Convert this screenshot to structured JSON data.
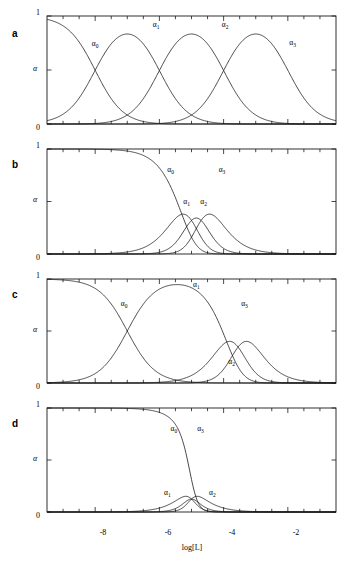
{
  "figure": {
    "axis": {
      "ylabel": "α",
      "ytick_top": "1",
      "ytick_bottom": "0",
      "xlabel": "log[L]",
      "xticks": [
        "-8",
        "-6",
        "-4",
        "-2"
      ],
      "xlim": [
        -9.5,
        -0.5
      ],
      "ylim": [
        0,
        1
      ],
      "xtick_values": [
        -8,
        -6,
        -4,
        -2
      ],
      "xminor_step": 0.5
    },
    "caption": "",
    "series_names": [
      "α0",
      "α1",
      "α2",
      "α3"
    ],
    "panels": [
      {
        "letter": "a",
        "ylabel": "α",
        "ytick_top": "1",
        "ytick_bottom": "0",
        "labels": [
          {
            "base": "α",
            "sub": "0",
            "x": -8.0,
            "y": 0.72
          },
          {
            "base": "α",
            "sub": "1",
            "x": -6.1,
            "y": 0.9
          },
          {
            "base": "α",
            "sub": "2",
            "x": -3.95,
            "y": 0.9
          },
          {
            "base": "α",
            "sub": "3",
            "x": -1.85,
            "y": 0.73
          }
        ],
        "logK": [
          -8.0,
          -6.0,
          -4.0,
          -2.0
        ],
        "description": "Four well separated stepwise constants; each species reaches near unity."
      },
      {
        "letter": "b",
        "ylabel": "α",
        "ytick_top": "1",
        "ytick_bottom": "0",
        "labels": [
          {
            "base": "α",
            "sub": "0",
            "x": -5.65,
            "y": 0.78
          },
          {
            "base": "α",
            "sub": "1",
            "x": -5.15,
            "y": 0.48
          },
          {
            "base": "α",
            "sub": "2",
            "x": -4.62,
            "y": 0.48
          },
          {
            "base": "α",
            "sub": "3",
            "x": -4.05,
            "y": 0.78
          }
        ],
        "logK": [
          -5.3,
          -5.0,
          -4.7,
          -4.4
        ],
        "description": "Closely spaced constants; intermediates only reach about 0.35."
      },
      {
        "letter": "c",
        "ylabel": "α",
        "ytick_top": "1",
        "ytick_bottom": "0",
        "labels": [
          {
            "base": "α",
            "sub": "0",
            "x": -7.1,
            "y": 0.74
          },
          {
            "base": "α",
            "sub": "1",
            "x": -4.85,
            "y": 0.92
          },
          {
            "base": "α",
            "sub": "3",
            "x": -3.35,
            "y": 0.74
          },
          {
            "base": "α",
            "sub": "2",
            "x": -3.75,
            "y": 0.18
          }
        ],
        "logK": [
          -7.0,
          -3.9,
          -3.55,
          -3.2
        ],
        "description": "First step well separated; last two overlap so alpha2 stays low."
      },
      {
        "letter": "d",
        "ylabel": "α",
        "ytick_top": "1",
        "ytick_bottom": "0",
        "labels": [
          {
            "base": "α",
            "sub": "0",
            "x": -5.55,
            "y": 0.78
          },
          {
            "base": "α",
            "sub": "3",
            "x": -4.72,
            "y": 0.78
          },
          {
            "base": "α",
            "sub": "1",
            "x": -5.75,
            "y": 0.16
          },
          {
            "base": "α",
            "sub": "2",
            "x": -4.35,
            "y": 0.16
          }
        ],
        "logK": [
          -4.6,
          -5.0,
          -5.0,
          -5.4
        ],
        "description": "Strongly anti-cooperative reversed order; only alpha0 and alpha3 are significant."
      }
    ]
  },
  "chart_data": {
    "type": "line",
    "title": "",
    "xlabel": "log[L]",
    "ylabel": "α",
    "xlim": [
      -9.5,
      -0.5
    ],
    "ylim": [
      0,
      1
    ],
    "xticks": [
      -8,
      -6,
      -4,
      -2
    ],
    "yticks": [
      0,
      1
    ],
    "grid": false,
    "legend": "inline curve labels",
    "panels": [
      {
        "id": "a",
        "logK": [
          -8.0,
          -6.0,
          -4.0,
          -2.0
        ],
        "series": [
          {
            "name": "α0",
            "x": [
              -9.5,
              -9.0,
              -8.5,
              -8.0,
              -7.5,
              -7.0,
              -6.5,
              -6.0,
              -5.5,
              -5.0,
              -4.5,
              -4.0,
              -3.5,
              -3.0,
              -2.5,
              -2.0,
              -1.5,
              -1.0,
              -0.5
            ],
            "values": [
              1.0,
              0.99,
              0.97,
              0.5,
              0.24,
              0.09,
              0.03,
              0.01,
              0.0,
              0.0,
              0.0,
              0.0,
              0.0,
              0.0,
              0.0,
              0.0,
              0.0,
              0.0,
              0.0
            ]
          },
          {
            "name": "α1",
            "x": [
              -9.5,
              -9.0,
              -8.5,
              -8.0,
              -7.5,
              -7.0,
              -6.5,
              -6.0,
              -5.5,
              -5.0,
              -4.5,
              -4.0,
              -3.5,
              -3.0,
              -2.5,
              -2.0,
              -1.5,
              -1.0,
              -0.5
            ],
            "values": [
              0.0,
              0.0,
              0.03,
              0.5,
              0.76,
              0.91,
              0.94,
              0.5,
              0.23,
              0.09,
              0.03,
              0.01,
              0.0,
              0.0,
              0.0,
              0.0,
              0.0,
              0.0,
              0.0
            ]
          },
          {
            "name": "α2",
            "x": [
              -9.5,
              -9.0,
              -8.5,
              -8.0,
              -7.5,
              -7.0,
              -6.5,
              -6.0,
              -5.5,
              -5.0,
              -4.5,
              -4.0,
              -3.5,
              -3.0,
              -2.5,
              -2.0,
              -1.5,
              -1.0,
              -0.5
            ],
            "values": [
              0.0,
              0.0,
              0.0,
              0.0,
              0.0,
              0.0,
              0.03,
              0.5,
              0.76,
              0.91,
              0.94,
              0.5,
              0.23,
              0.09,
              0.03,
              0.01,
              0.0,
              0.0,
              0.0
            ]
          },
          {
            "name": "α3",
            "x": [
              -9.5,
              -9.0,
              -8.5,
              -8.0,
              -7.5,
              -7.0,
              -6.5,
              -6.0,
              -5.5,
              -5.0,
              -4.5,
              -4.0,
              -3.5,
              -3.0,
              -2.5,
              -2.0,
              -1.5,
              -1.0,
              -0.5
            ],
            "values": [
              0.0,
              0.0,
              0.0,
              0.0,
              0.0,
              0.0,
              0.0,
              0.0,
              0.0,
              0.0,
              0.03,
              0.5,
              0.76,
              0.91,
              0.97,
              0.99,
              1.0,
              1.0,
              1.0
            ]
          }
        ]
      },
      {
        "id": "b",
        "logK": [
          -5.3,
          -5.0,
          -4.7,
          -4.4
        ],
        "series": [
          {
            "name": "α0",
            "x": [
              -9.5,
              -8.0,
              -7.0,
              -6.5,
              -6.0,
              -5.6,
              -5.3,
              -5.0,
              -4.7,
              -4.4,
              -4.0,
              -3.5,
              -3.0,
              -2.0,
              -0.5
            ],
            "values": [
              1.0,
              1.0,
              0.99,
              0.97,
              0.9,
              0.72,
              0.5,
              0.24,
              0.08,
              0.02,
              0.0,
              0.0,
              0.0,
              0.0,
              0.0
            ]
          },
          {
            "name": "α1",
            "x": [
              -9.5,
              -8.0,
              -7.0,
              -6.5,
              -6.0,
              -5.6,
              -5.3,
              -5.0,
              -4.7,
              -4.4,
              -4.0,
              -3.5,
              -3.0,
              -2.0,
              -0.5
            ],
            "values": [
              0.0,
              0.0,
              0.0,
              0.01,
              0.05,
              0.16,
              0.29,
              0.35,
              0.26,
              0.13,
              0.04,
              0.01,
              0.0,
              0.0,
              0.0
            ]
          },
          {
            "name": "α2",
            "x": [
              -9.5,
              -8.0,
              -7.0,
              -6.5,
              -6.0,
              -5.6,
              -5.3,
              -5.0,
              -4.7,
              -4.4,
              -4.0,
              -3.5,
              -3.0,
              -2.0,
              -0.5
            ],
            "values": [
              0.0,
              0.0,
              0.0,
              0.0,
              0.0,
              0.01,
              0.05,
              0.17,
              0.31,
              0.35,
              0.23,
              0.08,
              0.03,
              0.0,
              0.0
            ]
          },
          {
            "name": "α3",
            "x": [
              -9.5,
              -8.0,
              -7.0,
              -6.5,
              -6.0,
              -5.6,
              -5.3,
              -5.0,
              -4.7,
              -4.4,
              -4.0,
              -3.5,
              -3.0,
              -2.0,
              -0.5
            ],
            "values": [
              0.0,
              0.0,
              0.0,
              0.0,
              0.0,
              0.0,
              0.01,
              0.04,
              0.16,
              0.45,
              0.73,
              0.91,
              0.97,
              1.0,
              1.0
            ]
          }
        ]
      },
      {
        "id": "c",
        "logK": [
          -7.0,
          -3.9,
          -3.55,
          -3.2
        ],
        "series": [
          {
            "name": "α0",
            "x": [
              -9.5,
              -8.5,
              -8.0,
              -7.5,
              -7.0,
              -6.5,
              -6.0,
              -5.5,
              -5.0,
              -4.5,
              -4.0,
              -3.6,
              -3.2,
              -2.8,
              -2.0,
              -0.5
            ],
            "values": [
              1.0,
              0.97,
              0.9,
              0.76,
              0.5,
              0.24,
              0.09,
              0.03,
              0.01,
              0.0,
              0.0,
              0.0,
              0.0,
              0.0,
              0.0,
              0.0
            ]
          },
          {
            "name": "α1",
            "x": [
              -9.5,
              -8.5,
              -8.0,
              -7.5,
              -7.0,
              -6.5,
              -6.0,
              -5.5,
              -5.0,
              -4.5,
              -4.0,
              -3.6,
              -3.2,
              -2.8,
              -2.0,
              -0.5
            ],
            "values": [
              0.0,
              0.03,
              0.1,
              0.24,
              0.5,
              0.76,
              0.91,
              0.96,
              0.95,
              0.85,
              0.5,
              0.22,
              0.05,
              0.01,
              0.0,
              0.0
            ]
          },
          {
            "name": "α2",
            "x": [
              -9.5,
              -8.5,
              -8.0,
              -7.5,
              -7.0,
              -6.5,
              -6.0,
              -5.5,
              -5.0,
              -4.5,
              -4.0,
              -3.6,
              -3.2,
              -2.8,
              -2.0,
              -0.5
            ],
            "values": [
              0.0,
              0.0,
              0.0,
              0.0,
              0.0,
              0.0,
              0.0,
              0.01,
              0.03,
              0.08,
              0.15,
              0.18,
              0.13,
              0.06,
              0.01,
              0.0
            ]
          },
          {
            "name": "α3",
            "x": [
              -9.5,
              -8.5,
              -8.0,
              -7.5,
              -7.0,
              -6.5,
              -6.0,
              -5.5,
              -5.0,
              -4.5,
              -4.0,
              -3.6,
              -3.2,
              -2.8,
              -2.0,
              -0.5
            ],
            "values": [
              0.0,
              0.0,
              0.0,
              0.0,
              0.0,
              0.0,
              0.0,
              0.0,
              0.01,
              0.06,
              0.34,
              0.6,
              0.82,
              0.93,
              0.99,
              1.0
            ]
          }
        ]
      },
      {
        "id": "d",
        "logK": [
          -4.6,
          -5.0,
          -5.0,
          -5.4
        ],
        "series": [
          {
            "name": "α0",
            "x": [
              -9.5,
              -8.0,
              -7.0,
              -6.5,
              -6.0,
              -5.6,
              -5.3,
              -5.1,
              -5.0,
              -4.9,
              -4.7,
              -4.4,
              -4.0,
              -3.0,
              -0.5
            ],
            "values": [
              1.0,
              1.0,
              1.0,
              1.0,
              0.99,
              0.96,
              0.85,
              0.65,
              0.48,
              0.32,
              0.12,
              0.03,
              0.01,
              0.0,
              0.0
            ]
          },
          {
            "name": "α1",
            "x": [
              -9.5,
              -8.0,
              -7.0,
              -6.5,
              -6.0,
              -5.6,
              -5.3,
              -5.1,
              -5.0,
              -4.9,
              -4.7,
              -4.4,
              -4.0,
              -3.0,
              -0.5
            ],
            "values": [
              0.0,
              0.0,
              0.0,
              0.0,
              0.0,
              0.01,
              0.03,
              0.05,
              0.05,
              0.04,
              0.02,
              0.01,
              0.0,
              0.0,
              0.0
            ]
          },
          {
            "name": "α2",
            "x": [
              -9.5,
              -8.0,
              -7.0,
              -6.5,
              -6.0,
              -5.6,
              -5.3,
              -5.1,
              -5.0,
              -4.9,
              -4.7,
              -4.4,
              -4.0,
              -3.0,
              -0.5
            ],
            "values": [
              0.0,
              0.0,
              0.0,
              0.0,
              0.0,
              0.01,
              0.02,
              0.04,
              0.05,
              0.05,
              0.03,
              0.01,
              0.0,
              0.0,
              0.0
            ]
          },
          {
            "name": "α3",
            "x": [
              -9.5,
              -8.0,
              -7.0,
              -6.5,
              -6.0,
              -5.6,
              -5.3,
              -5.1,
              -5.0,
              -4.9,
              -4.7,
              -4.4,
              -4.0,
              -3.0,
              -0.5
            ],
            "values": [
              0.0,
              0.0,
              0.0,
              0.0,
              0.01,
              0.02,
              0.1,
              0.26,
              0.42,
              0.59,
              0.83,
              0.95,
              0.99,
              1.0,
              1.0
            ]
          }
        ]
      }
    ]
  }
}
